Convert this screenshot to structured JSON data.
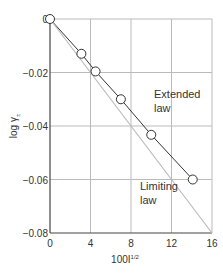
{
  "chart_data": {
    "type": "line",
    "title": "",
    "xlabel": "100I^1/2",
    "ylabel": "log γ±",
    "xlim": [
      0,
      16
    ],
    "ylim": [
      -0.08,
      0
    ],
    "x_ticks": [
      "0",
      "4",
      "8",
      "12",
      "16"
    ],
    "y_ticks": [
      "0",
      "−0.02",
      "−0.04",
      "−0.06",
      "−0.08"
    ],
    "grid": true,
    "series": [
      {
        "name": "Extended law",
        "marker": "open-circle",
        "x": [
          0,
          3.1,
          4.5,
          7.0,
          10.0,
          14.1
        ],
        "y": [
          0,
          -0.013,
          -0.0196,
          -0.03,
          -0.0433,
          -0.06
        ]
      },
      {
        "name": "Limiting law",
        "marker": "none",
        "x": [
          0,
          16
        ],
        "y": [
          0,
          -0.08
        ]
      }
    ],
    "annotations": [
      {
        "text": "Extended law",
        "x": 10.5,
        "y": -0.033
      },
      {
        "text": "Limiting law",
        "x": 11.0,
        "y": -0.064
      }
    ],
    "colors": {
      "extended": "#333333",
      "limiting": "#bbbbbb",
      "grid": "#bbbbbb"
    }
  },
  "labels": {
    "xlabel_main": "100I",
    "xlabel_sup": "1/2",
    "ylabel_main": "log γ",
    "ylabel_sub": "±",
    "extended_line1": "Extended",
    "extended_line2": "law",
    "limiting_line1": "Limiting",
    "limiting_line2": "law"
  }
}
